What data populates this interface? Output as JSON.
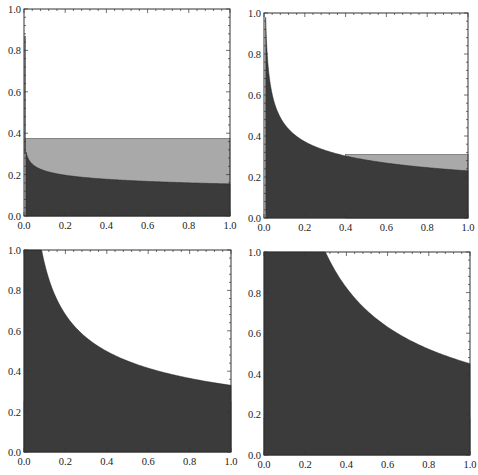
{
  "chart_data": [
    {
      "type": "area",
      "panel": "top-left",
      "title": "",
      "xlabel": "",
      "ylabel": "",
      "xlim": [
        0,
        1
      ],
      "ylim": [
        0,
        1
      ],
      "xticks": [
        "0.0",
        "0.2",
        "0.4",
        "0.6",
        "0.8",
        "1.0"
      ],
      "yticks": [
        "0.0",
        "0.2",
        "0.4",
        "0.6",
        "0.8",
        "1.0"
      ],
      "grid": false,
      "series": [
        {
          "name": "dark region",
          "color": "#3a3a3a",
          "x": [
            0.005,
            0.01,
            0.05,
            0.1,
            0.2,
            0.4,
            0.6,
            0.8,
            1.0
          ],
          "values": [
            0.87,
            0.3,
            0.25,
            0.22,
            0.2,
            0.18,
            0.17,
            0.16,
            0.155
          ]
        },
        {
          "name": "light band",
          "color": "#a8a8a8",
          "x": [
            0.005,
            1.0
          ],
          "values": [
            0.375,
            0.37
          ]
        }
      ]
    },
    {
      "type": "area",
      "panel": "top-right",
      "title": "",
      "xlabel": "",
      "ylabel": "",
      "xlim": [
        0,
        1
      ],
      "ylim": [
        0,
        1
      ],
      "xticks": [
        "0.0",
        "0.2",
        "0.4",
        "0.6",
        "0.8",
        "1.0"
      ],
      "yticks": [
        "0.0",
        "0.2",
        "0.4",
        "0.6",
        "0.8",
        "1.0"
      ],
      "grid": false,
      "series": [
        {
          "name": "dark region",
          "color": "#3a3a3a",
          "x": [
            0.005,
            0.01,
            0.05,
            0.1,
            0.2,
            0.4,
            0.6,
            0.8,
            1.0
          ],
          "values": [
            1.0,
            0.92,
            0.56,
            0.46,
            0.37,
            0.3,
            0.27,
            0.25,
            0.23
          ]
        },
        {
          "name": "light band",
          "color": "#a8a8a8",
          "x": [
            0.4,
            1.0
          ],
          "values": [
            0.31,
            0.31
          ]
        }
      ]
    },
    {
      "type": "area",
      "panel": "bottom-left",
      "title": "",
      "xlabel": "",
      "ylabel": "",
      "xlim": [
        0,
        1
      ],
      "ylim": [
        0,
        1
      ],
      "xticks": [
        "0.0",
        "0.2",
        "0.4",
        "0.6",
        "0.8",
        "1.0"
      ],
      "yticks": [
        "0.0",
        "0.2",
        "0.4",
        "0.6",
        "0.8",
        "1.0"
      ],
      "grid": false,
      "series": [
        {
          "name": "dark region",
          "color": "#3a3a3a",
          "x": [
            0.0,
            0.085,
            0.2,
            0.4,
            0.6,
            0.8,
            1.0
          ],
          "values": [
            1.0,
            1.0,
            0.68,
            0.5,
            0.42,
            0.37,
            0.33
          ]
        },
        {
          "name": "light band",
          "color": "#a8a8a8",
          "x": [
            0.0,
            1.0
          ],
          "values": [
            0.25,
            0.25
          ]
        }
      ]
    },
    {
      "type": "area",
      "panel": "bottom-right",
      "title": "",
      "xlabel": "",
      "ylabel": "",
      "xlim": [
        0,
        1
      ],
      "ylim": [
        0,
        1
      ],
      "xticks": [
        "0.0",
        "0.2",
        "0.4",
        "0.6",
        "0.8",
        "1.0"
      ],
      "yticks": [
        "0.0",
        "0.2",
        "0.4",
        "0.6",
        "0.8",
        "1.0"
      ],
      "grid": false,
      "series": [
        {
          "name": "dark region",
          "color": "#3a3a3a",
          "x": [
            0.0,
            0.3,
            0.4,
            0.6,
            0.8,
            1.0
          ],
          "values": [
            1.0,
            1.0,
            0.82,
            0.63,
            0.52,
            0.45
          ]
        },
        {
          "name": "light band",
          "color": "#a8a8a8",
          "x": [
            0.0,
            1.0
          ],
          "values": [
            0.185,
            0.18
          ]
        }
      ]
    }
  ],
  "panels": [
    {
      "box": [
        24,
        9,
        230,
        216
      ],
      "dark": {
        "k": 0.155,
        "p": 0.15,
        "xmin": 0.01
      },
      "light_top": 0.375,
      "light_from": 0.005,
      "spike": {
        "x": 0.005,
        "y": 0.87
      }
    },
    {
      "box": [
        264,
        13,
        468,
        218
      ],
      "dark": {
        "k": 0.23,
        "p": 0.3,
        "xmin": 0.008
      },
      "light_top": 0.31,
      "light_from": 0.4
    },
    {
      "box": [
        24,
        250,
        231,
        452
      ],
      "dark": {
        "k": 0.33,
        "p": 0.45,
        "xmin": 0.0
      },
      "light_top": 0.25,
      "light_from": 0.0
    },
    {
      "box": [
        264,
        252,
        470,
        455
      ],
      "dark": {
        "k": 0.45,
        "p": 0.66,
        "xmin": 0.0
      },
      "light_top": 0.18,
      "light_from": 0.0
    }
  ],
  "colors": {
    "dark": "#3b3b3b",
    "light": "#a9a9a9",
    "frame": "#333333",
    "background": "#ffffff"
  }
}
